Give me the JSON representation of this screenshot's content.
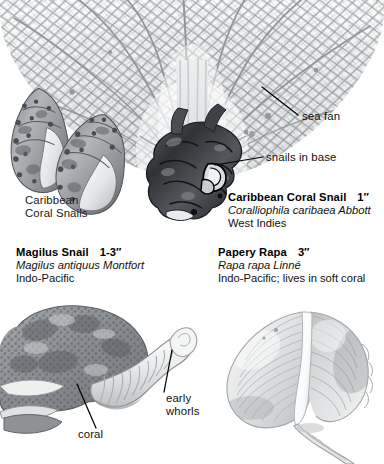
{
  "plate": {
    "background": "#ffffff",
    "ink": "#111111",
    "medium": "grayscale natural-history illustration"
  },
  "specimens": [
    {
      "id": "caribbean-coral-snails-pair",
      "caption_lines": [
        "Caribbean",
        "Coral Snails"
      ],
      "description": "two spiny knobbed coral snail shells, aperture facing viewer"
    },
    {
      "id": "caribbean-coral-snail",
      "common_name": "Caribbean Coral Snail",
      "size": "1″",
      "scientific_name": "Coralliophila caribaea Abbott",
      "locality": "West Indies",
      "description": "dark gnarled sea fan holdfast with snails embedded in base"
    },
    {
      "id": "magilus-snail",
      "common_name": "Magilus Snail",
      "size": "1-3″",
      "scientific_name": "Magilus antiquus Montfort",
      "locality": "Indo-Pacific",
      "description": "coral mass with long tubular shell extension and early whorls"
    },
    {
      "id": "papery-rapa",
      "common_name": "Papery Rapa",
      "size": "3″",
      "scientific_name": "Rapa rapa Linné",
      "locality": "Indo-Pacific; lives in soft coral",
      "description": "thin inflated pale shell with fine spiral ribbing and long canal"
    }
  ],
  "callouts": [
    {
      "id": "sea-fan",
      "label": "sea fan"
    },
    {
      "id": "snails-in-base",
      "label": "snails in base"
    },
    {
      "id": "coral",
      "label": "coral"
    },
    {
      "id": "early-whorls",
      "label_line1": "early",
      "label_line2": "whorls"
    }
  ]
}
